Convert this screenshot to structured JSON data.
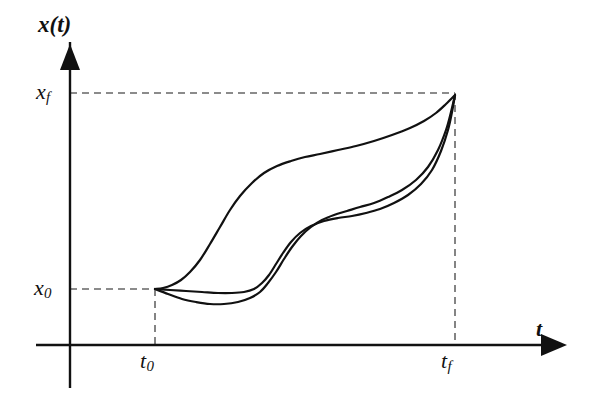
{
  "figure": {
    "title": "",
    "background_color": "#ffffff",
    "line_color": "#111111",
    "dash_color": "#666666",
    "width": 614,
    "height": 397
  },
  "labels": {
    "y_axis": "x(t)",
    "x_axis": "t",
    "x_final": "x",
    "x_final_sub": "f",
    "x_initial": "x",
    "x_initial_sub": "0",
    "t_initial": "t",
    "t_initial_sub": "0",
    "t_final": "t",
    "t_final_sub": "f"
  },
  "chart_data": {
    "type": "line",
    "title": "",
    "xlabel": "t",
    "ylabel": "x(t)",
    "grid": false,
    "legend": null,
    "xlim": [
      0,
      1.35
    ],
    "ylim": [
      -0.12,
      1.18
    ],
    "axis_origin_px": {
      "x": 70,
      "y": 345
    },
    "y_axis_arrow_tip_px": {
      "x": 70,
      "y": 22
    },
    "x_axis_arrow_tip_px": {
      "x": 575,
      "y": 345
    },
    "y_axis_bottom_px": 388,
    "x_axis_left_px": 36,
    "markers": {
      "t0": {
        "value": 0.0,
        "px": 155,
        "label": "t₀"
      },
      "tf": {
        "value": 1.0,
        "px": 455,
        "label": "t_f"
      },
      "x0": {
        "value": 0.0,
        "px": 289,
        "label": "x₀"
      },
      "xf": {
        "value": 1.0,
        "px": 93,
        "label": "x_f"
      }
    },
    "dashed_guides": [
      {
        "name": "xf-horizontal",
        "orientation": "horizontal",
        "from_px": [
          70,
          93
        ],
        "to_px": [
          455,
          93
        ]
      },
      {
        "name": "x0-horizontal",
        "orientation": "horizontal",
        "from_px": [
          70,
          289
        ],
        "to_px": [
          155,
          289
        ]
      },
      {
        "name": "t0-vertical",
        "orientation": "vertical",
        "from_px": [
          155,
          289
        ],
        "to_px": [
          155,
          345
        ]
      },
      {
        "name": "tf-vertical",
        "orientation": "vertical",
        "from_px": [
          455,
          93
        ],
        "to_px": [
          455,
          345
        ]
      }
    ],
    "series": [
      {
        "name": "trajectory-1",
        "description": "early rapid rise, long high plateau, converges at (t_f, x_f)",
        "points_px": [
          [
            155,
            289
          ],
          [
            163,
            288
          ],
          [
            172,
            285
          ],
          [
            181,
            280
          ],
          [
            190,
            272
          ],
          [
            200,
            260
          ],
          [
            210,
            244
          ],
          [
            220,
            227
          ],
          [
            230,
            210
          ],
          [
            240,
            196
          ],
          [
            252,
            183
          ],
          [
            264,
            173
          ],
          [
            277,
            166
          ],
          [
            291,
            161
          ],
          [
            305,
            157
          ],
          [
            320,
            154
          ],
          [
            338,
            150
          ],
          [
            356,
            146
          ],
          [
            374,
            141
          ],
          [
            392,
            135
          ],
          [
            410,
            128
          ],
          [
            424,
            121
          ],
          [
            436,
            113
          ],
          [
            446,
            104
          ],
          [
            455,
            95
          ]
        ]
      },
      {
        "name": "trajectory-2",
        "description": "nearly flat at x0 then mid-range rise with shoulder, converges at (t_f, x_f)",
        "points_px": [
          [
            155,
            289
          ],
          [
            170,
            290
          ],
          [
            186,
            291
          ],
          [
            202,
            292
          ],
          [
            218,
            293
          ],
          [
            232,
            293
          ],
          [
            244,
            292
          ],
          [
            254,
            289
          ],
          [
            262,
            283
          ],
          [
            269,
            275
          ],
          [
            276,
            264
          ],
          [
            283,
            253
          ],
          [
            291,
            242
          ],
          [
            300,
            233
          ],
          [
            311,
            226
          ],
          [
            324,
            221
          ],
          [
            338,
            218
          ],
          [
            352,
            216
          ],
          [
            366,
            213
          ],
          [
            380,
            209
          ],
          [
            394,
            203
          ],
          [
            408,
            195
          ],
          [
            421,
            184
          ],
          [
            432,
            170
          ],
          [
            441,
            151
          ],
          [
            448,
            130
          ],
          [
            452,
            112
          ],
          [
            455,
            95
          ]
        ]
      },
      {
        "name": "trajectory-3",
        "description": "dips below x0, shallow trough, late steep S-rise, converges at (t_f, x_f)",
        "points_px": [
          [
            155,
            289
          ],
          [
            168,
            294
          ],
          [
            182,
            299
          ],
          [
            196,
            302
          ],
          [
            210,
            304
          ],
          [
            224,
            304
          ],
          [
            238,
            302
          ],
          [
            250,
            298
          ],
          [
            260,
            292
          ],
          [
            268,
            283
          ],
          [
            276,
            272
          ],
          [
            284,
            259
          ],
          [
            292,
            247
          ],
          [
            301,
            236
          ],
          [
            311,
            227
          ],
          [
            322,
            220
          ],
          [
            334,
            215
          ],
          [
            347,
            211
          ],
          [
            360,
            207
          ],
          [
            374,
            203
          ],
          [
            388,
            197
          ],
          [
            402,
            190
          ],
          [
            416,
            180
          ],
          [
            428,
            167
          ],
          [
            438,
            150
          ],
          [
            446,
            130
          ],
          [
            451,
            112
          ],
          [
            455,
            95
          ]
        ]
      }
    ]
  }
}
